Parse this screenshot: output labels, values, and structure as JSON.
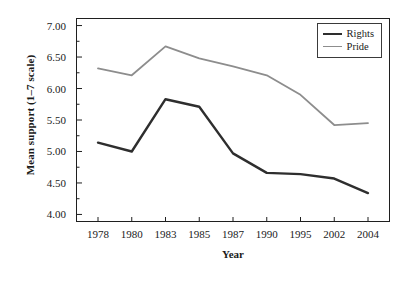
{
  "chart_data": {
    "type": "line",
    "title": "",
    "xlabel": "Year",
    "ylabel": "Mean support (1–7 scale)",
    "categories": [
      "1978",
      "1980",
      "1983",
      "1985",
      "1987",
      "1990",
      "1995",
      "2002",
      "2004"
    ],
    "ylim": [
      3.88,
      7.12
    ],
    "ytick_values": [
      4.0,
      4.5,
      5.0,
      5.5,
      6.0,
      6.5,
      7.0
    ],
    "ytick_labels": [
      "4.00",
      "4.50",
      "5.00",
      "5.50",
      "6.00",
      "6.50",
      "7.00"
    ],
    "yminor_values": [
      4.25,
      4.75,
      5.25,
      5.75,
      6.25,
      6.75
    ],
    "grid": false,
    "legend_position": "top-right-inside",
    "series": [
      {
        "name": "Rights",
        "color": "#2e2e2e",
        "width": 2.4,
        "values": [
          5.14,
          5.0,
          5.83,
          5.71,
          4.97,
          4.66,
          4.64,
          4.57,
          4.34
        ]
      },
      {
        "name": "Pride",
        "color": "#8d8d8d",
        "width": 1.8,
        "values": [
          6.32,
          6.21,
          6.67,
          6.48,
          6.35,
          6.21,
          5.9,
          5.42,
          5.45
        ]
      }
    ]
  },
  "axes": {
    "frame_color": "#1f1f1f",
    "tick_color": "#1f1f1f"
  }
}
